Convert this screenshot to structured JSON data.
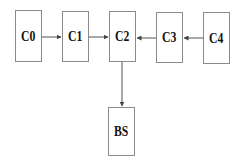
{
  "diagram": {
    "nodes": [
      {
        "id": "C0",
        "label": "C0",
        "x": 15,
        "y": 10,
        "w": 27,
        "h": 52
      },
      {
        "id": "C1",
        "label": "C1",
        "x": 62,
        "y": 11,
        "w": 27,
        "h": 51
      },
      {
        "id": "C2",
        "label": "C2",
        "x": 109,
        "y": 11,
        "w": 27,
        "h": 51
      },
      {
        "id": "C3",
        "label": "C3",
        "x": 156,
        "y": 12,
        "w": 27,
        "h": 51
      },
      {
        "id": "C4",
        "label": "C4",
        "x": 203,
        "y": 12,
        "w": 27,
        "h": 52
      },
      {
        "id": "BS",
        "label": "BS",
        "x": 108,
        "y": 107,
        "w": 27,
        "h": 49
      }
    ],
    "edges": [
      {
        "from": "C0",
        "to": "C1"
      },
      {
        "from": "C1",
        "to": "C2"
      },
      {
        "from": "C3",
        "to": "C2"
      },
      {
        "from": "C4",
        "to": "C3"
      },
      {
        "from": "C2",
        "to": "BS"
      }
    ],
    "colors": {
      "border": "#8a8a8a",
      "arrow": "#555555",
      "text": "#111111"
    }
  }
}
